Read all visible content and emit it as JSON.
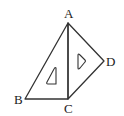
{
  "diagram": {
    "title": "",
    "points": {
      "A": {
        "label": "A",
        "x": 68,
        "y": 23
      },
      "B": {
        "label": "B",
        "x": 25,
        "y": 99
      },
      "C": {
        "label": "C",
        "x": 68,
        "y": 99
      },
      "D": {
        "label": "D",
        "x": 104,
        "y": 61
      }
    },
    "segments": [
      "AB",
      "BC",
      "AC",
      "AD",
      "CD"
    ],
    "shapes": [
      "triangle-ABC (set square)",
      "triangle-ACD (set square)"
    ],
    "stroke_color": "#333333"
  }
}
